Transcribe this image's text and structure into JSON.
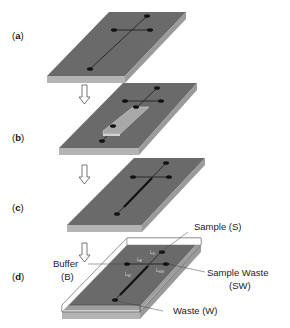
{
  "figure": {
    "panels": [
      {
        "id": "a",
        "label_open": "(",
        "label_letter": "a",
        "label_close": ")",
        "description": "Base substrate with cross-shaped microchannel and four reservoirs"
      },
      {
        "id": "b",
        "label_open": "(",
        "label_letter": "b",
        "label_close": ")",
        "description": "Substrate with overlay strip covering separation channel"
      },
      {
        "id": "c",
        "label_open": "(",
        "label_letter": "c",
        "label_close": ")",
        "description": "Substrate with modified (thickened) separation channel"
      },
      {
        "id": "d",
        "label_open": "(",
        "label_letter": "d",
        "label_close": ")",
        "description": "Sealed chip with cover layer and labeled reservoirs and channel lengths"
      }
    ],
    "annotations": {
      "sample": "Sample (S)",
      "buffer_line1": "Buffer",
      "buffer_line2": "(B)",
      "sample_waste_line1": "Sample Waste",
      "sample_waste_line2": "(SW)",
      "waste": "Waste (W)"
    },
    "channel_lengths": {
      "ls": "L",
      "ls_sub": "S",
      "lb": "L",
      "lb_sub": "B",
      "lw": "L",
      "lw_sub": "W",
      "lsw": "L",
      "lsw_sub": "SW"
    },
    "colors": {
      "top_face": "#6a6a6a",
      "front_edge": "#b4b4b4",
      "side_edge": "#9a9a9a",
      "channel": "#1a1a1a",
      "overlay": "#a8a8a8",
      "cover_outline": "#555555"
    }
  }
}
